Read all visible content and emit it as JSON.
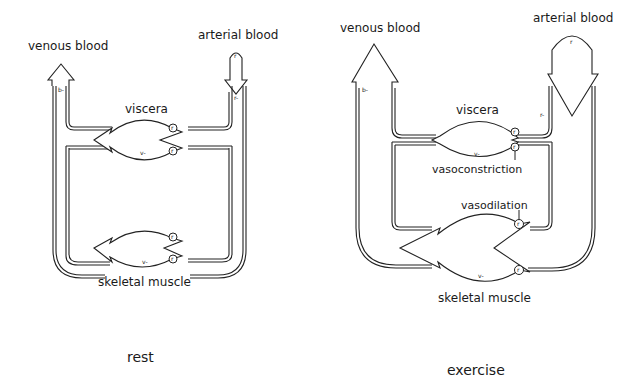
{
  "panels": [
    {
      "id": "rest",
      "caption": "rest",
      "labels": {
        "venous": "venous blood",
        "arterial": "arterial blood",
        "viscera": "viscera",
        "skeletal": "skeletal muscle",
        "b_marker": "b-",
        "r_marker": "r-",
        "r_arrow": "r",
        "v_viscera": "v-",
        "v_muscle": "v-",
        "resistor": "r"
      }
    },
    {
      "id": "exercise",
      "caption": "exercise",
      "labels": {
        "venous": "venous blood",
        "arterial": "arterial blood",
        "viscera": "viscera",
        "skeletal": "skeletal muscle",
        "vasoconstriction": "vasoconstriction",
        "vasodilation": "vasodilation",
        "b_marker": "b-",
        "r_marker": "r-",
        "r_arrow": "r",
        "v_viscera": "v-",
        "v_muscle": "v-",
        "resistor": "r"
      }
    }
  ],
  "colors": {
    "ink": "#222222",
    "background": "#ffffff"
  }
}
